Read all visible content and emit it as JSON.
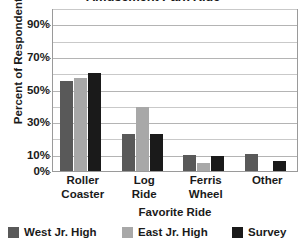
{
  "chart_data": {
    "type": "bar",
    "title": "Amusement Park Ride",
    "xlabel": "Favorite Ride",
    "ylabel": "Percent of Respondents",
    "categories": [
      "Roller Coaster",
      "Log Ride",
      "Ferris Wheel",
      "Other"
    ],
    "category_lines": [
      [
        "Roller",
        "Coaster"
      ],
      [
        "Log",
        "Ride"
      ],
      [
        "Ferris",
        "Wheel"
      ],
      [
        "Other",
        ""
      ]
    ],
    "series": [
      {
        "name": "West Jr. High",
        "color": "#595959",
        "values": [
          55,
          23,
          10,
          10.5
        ]
      },
      {
        "name": "East Jr. High",
        "color": "#a8a8a8",
        "values": [
          57,
          39,
          5,
          0
        ]
      },
      {
        "name": "Survey",
        "color": "#1a1a1a",
        "values": [
          60,
          23,
          9.5,
          6
        ]
      }
    ],
    "ylim": [
      0,
      100
    ],
    "y_ticks": [
      0,
      10,
      30,
      50,
      70,
      90
    ],
    "y_tick_labels": [
      "0%",
      "10%",
      "30%",
      "50%",
      "70%",
      "90%"
    ],
    "y_minor_ticks": [
      20,
      40,
      60,
      80,
      100
    ],
    "grid": true,
    "legend_position": "bottom"
  }
}
